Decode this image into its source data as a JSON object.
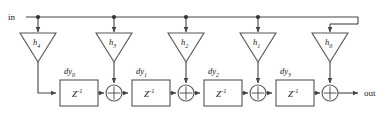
{
  "diagram": {
    "type": "signal-flow-block-diagram",
    "colors": {
      "line": "#444444",
      "shape_stroke": "#555555",
      "shape_fill": "#ffffff",
      "text": "#1a1a1a",
      "background": "#ffffff"
    },
    "ports": {
      "input_label": "in",
      "output_label": "out"
    },
    "coefficients": [
      {
        "id": "h4",
        "base": "h",
        "subscript": "4",
        "cx": 38,
        "tri_top_y": 33,
        "tri_bottom_y": 62,
        "half_width": 18
      },
      {
        "id": "h3",
        "base": "h",
        "subscript": "3",
        "cx": 114,
        "tri_top_y": 33,
        "tri_bottom_y": 62,
        "half_width": 18
      },
      {
        "id": "h2",
        "base": "h",
        "subscript": "2",
        "cx": 186,
        "tri_top_y": 33,
        "tri_bottom_y": 62,
        "half_width": 18
      },
      {
        "id": "h1",
        "base": "h",
        "subscript": "1",
        "cx": 258,
        "tri_top_y": 33,
        "tri_bottom_y": 62,
        "half_width": 18
      },
      {
        "id": "h0",
        "base": "h",
        "subscript": "0",
        "cx": 330,
        "tri_top_y": 33,
        "tri_bottom_y": 62,
        "half_width": 18
      }
    ],
    "delays": [
      {
        "id": "z1-0",
        "box_label": "Z",
        "box_exponent": "-1",
        "tap_base": "dy",
        "tap_sub": "0",
        "x": 60,
        "y": 80,
        "w": 38,
        "h": 26
      },
      {
        "id": "z1-1",
        "box_label": "Z",
        "box_exponent": "-1",
        "tap_base": "dy",
        "tap_sub": "1",
        "x": 132,
        "y": 80,
        "w": 38,
        "h": 26
      },
      {
        "id": "z1-2",
        "box_label": "Z",
        "box_exponent": "-1",
        "tap_base": "dy",
        "tap_sub": "2",
        "x": 204,
        "y": 80,
        "w": 38,
        "h": 26
      },
      {
        "id": "z1-3",
        "box_label": "Z",
        "box_exponent": "-1",
        "tap_base": "dy",
        "tap_sub": "3",
        "x": 276,
        "y": 80,
        "w": 38,
        "h": 26
      }
    ],
    "adders": [
      {
        "id": "add-0",
        "cx": 114,
        "cy": 93,
        "r": 8
      },
      {
        "id": "add-1",
        "cx": 186,
        "cy": 93,
        "r": 8
      },
      {
        "id": "add-2",
        "cx": 258,
        "cy": 93,
        "r": 8
      },
      {
        "id": "add-3",
        "cx": 330,
        "cy": 93,
        "r": 8
      }
    ],
    "bus": {
      "y": 17,
      "x_start": 26,
      "x_end": 358,
      "tap_dots": [
        38,
        114,
        186,
        258
      ]
    },
    "labels": {
      "in_x": 8,
      "in_y": 20,
      "out_x": 364,
      "out_y": 96
    }
  }
}
